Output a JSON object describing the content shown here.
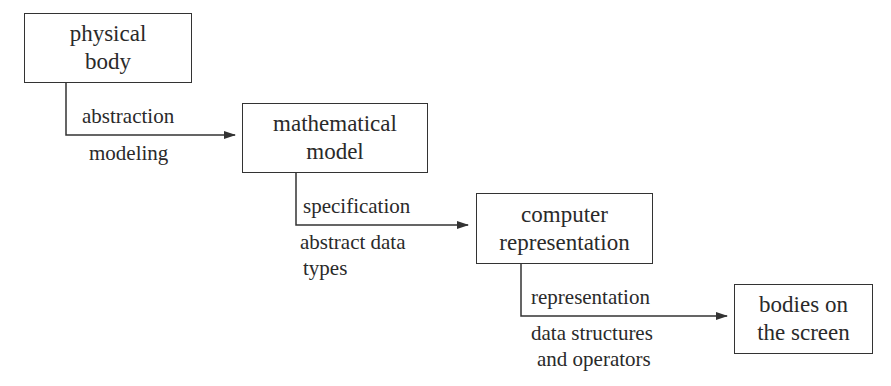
{
  "boxes": [
    {
      "line1": "physical",
      "line2": "body"
    },
    {
      "line1": "mathematical",
      "line2": "model"
    },
    {
      "line1": "computer",
      "line2": "representation"
    },
    {
      "line1": "bodies on",
      "line2": "the screen"
    }
  ],
  "arrows": [
    {
      "above": "abstraction",
      "below1": "modeling",
      "below2": ""
    },
    {
      "above": "specification",
      "below1": "abstract data",
      "below2": "types"
    },
    {
      "above": "representation",
      "below1": "data structures",
      "below2": "and operators"
    }
  ],
  "colors": {
    "line": "#333333",
    "text": "#2a2a2a",
    "background": "#ffffff"
  }
}
